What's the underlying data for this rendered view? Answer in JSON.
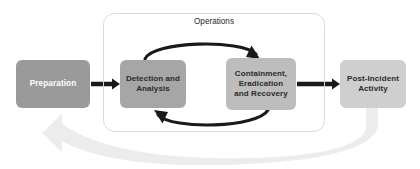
{
  "diagram": {
    "background_color": "#ffffff",
    "group": {
      "label": "Operations",
      "border_color": "#d9d9d9"
    },
    "nodes": [
      {
        "id": "preparation",
        "label": "Preparation",
        "fill": "#9a9a9a",
        "text_color": "#ffffff"
      },
      {
        "id": "detection-and-analysis",
        "label": "Detection and\nAnalysis",
        "fill": "#a6a6a6",
        "text_color": "#2b2b2b"
      },
      {
        "id": "containment-eradication-and-recovery",
        "label": "Containment,\nEradication\nand Recovery",
        "fill": "#bdbdbd",
        "text_color": "#2b2b2b"
      },
      {
        "id": "post-incident-activity",
        "label": "Post-Incident\nActivity",
        "fill": "#cfcfcf",
        "text_color": "#2b2b2b"
      }
    ],
    "connectors": [
      {
        "id": "prep-to-detection",
        "from": "preparation",
        "to": "detection-and-analysis",
        "style": "straight",
        "color": "#1a1a1a"
      },
      {
        "id": "detection-to-containment",
        "from": "detection-and-analysis",
        "to": "containment-eradication-and-recovery",
        "style": "curve-top",
        "color": "#1a1a1a"
      },
      {
        "id": "containment-to-detection",
        "from": "containment-eradication-and-recovery",
        "to": "detection-and-analysis",
        "style": "curve-bottom",
        "color": "#1a1a1a"
      },
      {
        "id": "containment-to-postincident",
        "from": "containment-eradication-and-recovery",
        "to": "post-incident-activity",
        "style": "straight",
        "color": "#1a1a1a"
      },
      {
        "id": "postincident-to-preparation",
        "from": "post-incident-activity",
        "to": "preparation",
        "style": "sweep-feedback",
        "color": "#ececec"
      }
    ]
  }
}
